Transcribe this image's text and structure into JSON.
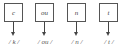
{
  "diagram": {
    "units": [
      {
        "grapheme": "c",
        "phoneme": "/ k /"
      },
      {
        "grapheme": "ou",
        "phoneme": "/ ou /"
      },
      {
        "grapheme": "n",
        "phoneme": "/ n /"
      },
      {
        "grapheme": "t",
        "phoneme": "/ t /"
      }
    ]
  }
}
